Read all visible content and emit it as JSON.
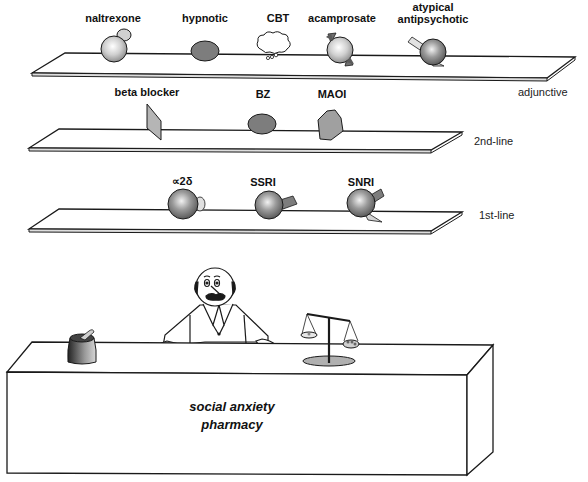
{
  "diagram": {
    "title": "social anxiety pharmacy",
    "desk": {
      "label_line1": "social anxiety",
      "label_line2": "pharmacy"
    },
    "shelves": [
      {
        "tier": "adjunctive",
        "items": [
          {
            "label": "naltrexone",
            "shape": "sphere-with-knob"
          },
          {
            "label": "hypnotic",
            "shape": "dark-ellipse"
          },
          {
            "label": "CBT",
            "shape": "thought-cloud"
          },
          {
            "label": "acamprosate",
            "shape": "sphere-with-wedges"
          },
          {
            "label_line1": "atypical",
            "label_line2": "antipsychotic",
            "shape": "sphere-with-rod-and-wedge"
          }
        ]
      },
      {
        "tier": "2nd-line",
        "items": [
          {
            "label": "beta blocker",
            "shape": "parallelogram-plate"
          },
          {
            "label": "BZ",
            "shape": "dark-ellipse"
          },
          {
            "label": "MAOI",
            "shape": "hexagon"
          }
        ]
      },
      {
        "tier": "1st-line",
        "items": [
          {
            "label": "∝2δ",
            "shape": "sphere-with-bump"
          },
          {
            "label": "SSRI",
            "shape": "sphere-with-rod"
          },
          {
            "label": "SNRI",
            "shape": "sphere-with-rod-and-wedge"
          }
        ]
      }
    ],
    "figures": {
      "pharmacist": "cartoon-pharmacist",
      "mortar": "mortar-and-pestle",
      "scale": "balance-scale"
    },
    "colors": {
      "line": "#1a1a1a",
      "sphere_light": "#e6e6e6",
      "sphere_dark": "#8a8a8a",
      "ellipse_fill": "#7d7d7d",
      "plate_fill": "#b5b5b5",
      "hexagon_fill": "#a0a0a0",
      "scale_base": "#b0b0b0"
    }
  }
}
